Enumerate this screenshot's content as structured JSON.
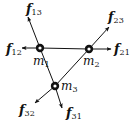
{
  "diagram": {
    "type": "free-body force diagram",
    "colors": {
      "line": "#111111",
      "background": "#ffffff",
      "node_fill": "#111111",
      "node_center": "#ffffff"
    },
    "masses": [
      {
        "id": "m1",
        "label": "m",
        "sub": "1",
        "x": 40,
        "y": 48
      },
      {
        "id": "m2",
        "label": "m",
        "sub": "2",
        "x": 89,
        "y": 49
      },
      {
        "id": "m3",
        "label": "m",
        "sub": "3",
        "x": 55,
        "y": 86
      }
    ],
    "connections": [
      {
        "from": "m1",
        "to": "m2"
      },
      {
        "from": "m1",
        "to": "m3"
      },
      {
        "from": "m2",
        "to": "m3"
      }
    ],
    "forces": [
      {
        "id": "f13",
        "label": "f",
        "sub": "13",
        "on": "m1",
        "tip": [
          28,
          16
        ]
      },
      {
        "id": "f12",
        "label": "f",
        "sub": "12",
        "on": "m1",
        "tip": [
          22,
          48
        ]
      },
      {
        "id": "f23",
        "label": "f",
        "sub": "23",
        "on": "m2",
        "tip": [
          109,
          26
        ]
      },
      {
        "id": "f21",
        "label": "f",
        "sub": "21",
        "on": "m2",
        "tip": [
          112,
          49
        ]
      },
      {
        "id": "f32",
        "label": "f",
        "sub": "32",
        "on": "m3",
        "tip": [
          34,
          104
        ]
      },
      {
        "id": "f31",
        "label": "f",
        "sub": "31",
        "on": "m3",
        "tip": [
          63,
          109
        ]
      }
    ]
  }
}
